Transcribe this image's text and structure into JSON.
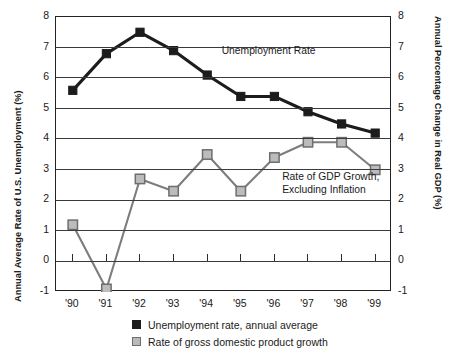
{
  "chart_data": {
    "type": "line",
    "title": "",
    "xlabel": "",
    "ylabel": "Annual Average Rate of U.S. Unemployment (%)",
    "ylabel_right": "Annual Percentage Change in Real GDP (%)",
    "x": [
      "'90",
      "'91",
      "'92",
      "'93",
      "'94",
      "'95",
      "'96",
      "'97",
      "'98",
      "'99"
    ],
    "categories": [
      "'90",
      "'91",
      "'92",
      "'93",
      "'94",
      "'95",
      "'96",
      "'97",
      "'98",
      "'99"
    ],
    "ylim": [
      -1,
      8
    ],
    "ylim_right": [
      -1,
      8
    ],
    "yticks": [
      "8",
      "7",
      "6",
      "5",
      "4",
      "3",
      "2",
      "1",
      "0",
      "-1"
    ],
    "yticks_right": [
      "8",
      "7",
      "6",
      "5",
      "4",
      "3",
      "2",
      "1",
      "0",
      "-1"
    ],
    "grid": true,
    "legend_position": "bottom",
    "series": [
      {
        "name": "Unemployment rate, annual average",
        "marker": "filled-square",
        "color": "#1c1c1c",
        "values": [
          5.6,
          6.8,
          7.5,
          6.9,
          6.1,
          5.4,
          5.4,
          4.9,
          4.5,
          4.2
        ]
      },
      {
        "name": "Rate of gross domestic product growth",
        "marker": "open-square",
        "color": "#b9b9b9",
        "values": [
          1.2,
          -0.9,
          2.7,
          2.3,
          3.5,
          2.3,
          3.4,
          3.9,
          3.9,
          3.0
        ]
      }
    ],
    "annotations": [
      {
        "text": "Unemployment Rate",
        "x": 4.55,
        "y": 6.85
      },
      {
        "text": "Rate of GDP Growth,",
        "x": 6.35,
        "y": 2.72
      },
      {
        "text": "Excluding Inflation",
        "x": 6.35,
        "y": 2.3
      }
    ]
  },
  "legend": {
    "items": [
      {
        "label": "Unemployment rate, annual average",
        "swatch": "filled-square-black"
      },
      {
        "label": "Rate of gross domestic product growth",
        "swatch": "open-square-gray"
      }
    ]
  }
}
